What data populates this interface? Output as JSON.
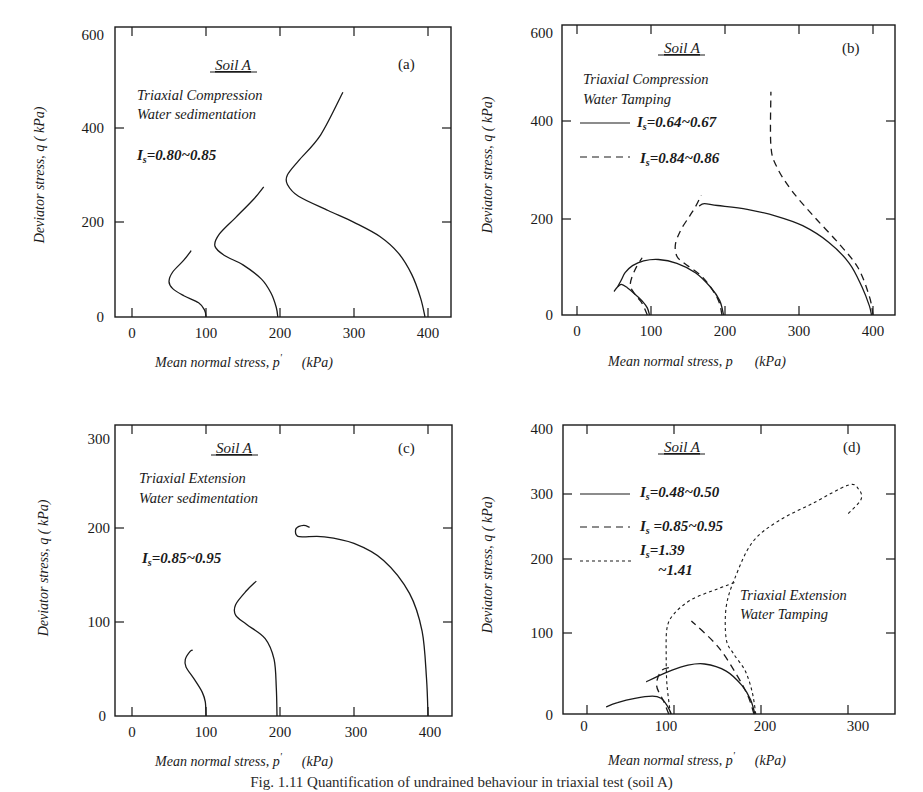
{
  "figure_caption": "Fig. 1.11  Quantification of undrained behaviour in triaxial test (soil A)",
  "chart_data": [
    {
      "id": "a",
      "type": "line",
      "panel_label": "(a)",
      "title": "Soil A",
      "annotations": [
        "Triaxial Compression",
        "Water sedimentation",
        "Is=0.80~0.85"
      ],
      "xlabel": "Mean normal stress, p'  (kPa)",
      "ylabel": "Deviator stress, q  (kPa)",
      "xlim": [
        -25,
        425
      ],
      "ylim": [
        0,
        600
      ],
      "xticks": [
        0,
        100,
        200,
        300,
        400
      ],
      "yticks": [
        0,
        200,
        400,
        600
      ],
      "grid": false,
      "frame": {
        "left": 115,
        "right": 451,
        "top": 27,
        "bottom": 317,
        "x0px": 132,
        "x1px": 428,
        "x0": 0,
        "x1": 400,
        "y0px": 317,
        "y1px": 33,
        "y0": 0,
        "y1": 600
      },
      "series": [
        {
          "name": "p0=100",
          "style": "solid",
          "points": [
            [
              100,
              0
            ],
            [
              98,
              15
            ],
            [
              90,
              30
            ],
            [
              70,
              45
            ],
            [
              55,
              60
            ],
            [
              50,
              75
            ],
            [
              55,
              95
            ],
            [
              70,
              120
            ],
            [
              80,
              140
            ]
          ]
        },
        {
          "name": "p0=200",
          "style": "solid",
          "points": [
            [
              197,
              0
            ],
            [
              195,
              20
            ],
            [
              188,
              50
            ],
            [
              175,
              80
            ],
            [
              150,
              110
            ],
            [
              125,
              130
            ],
            [
              112,
              150
            ],
            [
              118,
              175
            ],
            [
              140,
              210
            ],
            [
              165,
              250
            ],
            [
              178,
              275
            ]
          ]
        },
        {
          "name": "p0=400",
          "style": "solid",
          "points": [
            [
              396,
              0
            ],
            [
              390,
              40
            ],
            [
              378,
              90
            ],
            [
              360,
              135
            ],
            [
              335,
              170
            ],
            [
              300,
              200
            ],
            [
              265,
              225
            ],
            [
              225,
              255
            ],
            [
              210,
              280
            ],
            [
              210,
              300
            ],
            [
              225,
              330
            ],
            [
              255,
              385
            ],
            [
              285,
              475
            ]
          ]
        }
      ]
    },
    {
      "id": "b",
      "type": "line",
      "panel_label": "(b)",
      "title": "Soil A",
      "annotations": [
        "Triaxial Compression",
        "Water Tamping"
      ],
      "legend": [
        {
          "label": "Is=0.64~0.67",
          "style": "solid"
        },
        {
          "label": "Is=0.84~0.86",
          "style": "dashed"
        }
      ],
      "xlabel": "Mean normal stress, p  (kPa)",
      "ylabel": "Deviator stress, q  (kPa)",
      "xlim": [
        -25,
        425
      ],
      "ylim": [
        0,
        600
      ],
      "xticks": [
        0,
        100,
        200,
        300,
        400
      ],
      "yticks": [
        0,
        200,
        400,
        600
      ],
      "grid": false,
      "frame": {
        "left": 562,
        "right": 895,
        "top": 25,
        "bottom": 315,
        "x0px": 577,
        "x1px": 873,
        "x0": 0,
        "x1": 400,
        "y0px": 315,
        "y1px": 33,
        "y0": 0,
        "y1": 600
      },
      "series": [
        {
          "name": "Is=0.64~0.67 p0=100",
          "style": "solid",
          "points": [
            [
              98,
              0
            ],
            [
              95,
              15
            ],
            [
              88,
              30
            ],
            [
              78,
              45
            ],
            [
              68,
              58
            ],
            [
              60,
              65
            ],
            [
              55,
              60
            ],
            [
              50,
              50
            ]
          ]
        },
        {
          "name": "Is=0.64~0.67 p0=200",
          "style": "solid",
          "points": [
            [
              198,
              0
            ],
            [
              193,
              30
            ],
            [
              180,
              60
            ],
            [
              160,
              90
            ],
            [
              135,
              110
            ],
            [
              110,
              118
            ],
            [
              90,
              115
            ],
            [
              75,
              105
            ],
            [
              65,
              90
            ],
            [
              60,
              75
            ],
            [
              55,
              60
            ]
          ]
        },
        {
          "name": "Is=0.64~0.67 p0=400",
          "style": "solid",
          "points": [
            [
              398,
              0
            ],
            [
              395,
              20
            ],
            [
              385,
              60
            ],
            [
              368,
              110
            ],
            [
              340,
              155
            ],
            [
              305,
              190
            ],
            [
              270,
              210
            ],
            [
              230,
              225
            ],
            [
              190,
              233
            ],
            [
              172,
              237
            ],
            [
              165,
              232
            ]
          ]
        },
        {
          "name": "Is=0.84~0.86 p0=100",
          "style": "dashed",
          "points": [
            [
              95,
              0
            ],
            [
              88,
              25
            ],
            [
              78,
              45
            ],
            [
              72,
              65
            ],
            [
              78,
              95
            ],
            [
              88,
              122
            ]
          ]
        },
        {
          "name": "Is=0.84~0.86 p0=200",
          "style": "dashed",
          "points": [
            [
              196,
              0
            ],
            [
              190,
              35
            ],
            [
              170,
              80
            ],
            [
              145,
              110
            ],
            [
              135,
              125
            ],
            [
              133,
              150
            ],
            [
              140,
              180
            ],
            [
              152,
              210
            ],
            [
              160,
              230
            ],
            [
              168,
              255
            ]
          ]
        },
        {
          "name": "Is=0.84~0.86 p0=400",
          "style": "dashed",
          "points": [
            [
              400,
              0
            ],
            [
              395,
              40
            ],
            [
              380,
              100
            ],
            [
              355,
              150
            ],
            [
              320,
              210
            ],
            [
              290,
              265
            ],
            [
              270,
              315
            ],
            [
              262,
              360
            ],
            [
              262,
              475
            ]
          ]
        }
      ]
    },
    {
      "id": "c",
      "type": "line",
      "panel_label": "(c)",
      "title": "Soil A",
      "annotations": [
        "Triaxial Extension",
        "Water sedimentation",
        "Is=0.85~0.95"
      ],
      "xlabel": "Mean normal stress, p'  (kPa)",
      "ylabel": "Deviator stress, q  (kPa)",
      "xlim": [
        -25,
        425
      ],
      "ylim": [
        0,
        300
      ],
      "xticks": [
        0,
        100,
        200,
        300,
        400
      ],
      "yticks": [
        0,
        100,
        200,
        300
      ],
      "grid": false,
      "frame": {
        "left": 115,
        "right": 452,
        "top": 425,
        "bottom": 716,
        "x0px": 132,
        "x1px": 428,
        "x0": 0,
        "x1": 400,
        "y0px": 716,
        "y1px": 433,
        "y0": 0,
        "y1": 300
      },
      "series": [
        {
          "name": "p0=100",
          "style": "solid",
          "points": [
            [
              100,
              0
            ],
            [
              99,
              15
            ],
            [
              95,
              25
            ],
            [
              85,
              38
            ],
            [
              73,
              52
            ],
            [
              72,
              60
            ],
            [
              78,
              68
            ],
            [
              82,
              70
            ]
          ]
        },
        {
          "name": "p0=200",
          "style": "solid",
          "points": [
            [
              196,
              0
            ],
            [
              195,
              30
            ],
            [
              192,
              60
            ],
            [
              180,
              82
            ],
            [
              155,
              97
            ],
            [
              140,
              107
            ],
            [
              140,
              118
            ],
            [
              155,
              133
            ],
            [
              168,
              143
            ]
          ]
        },
        {
          "name": "p0=400",
          "style": "solid",
          "points": [
            [
              400,
              0
            ],
            [
              398,
              40
            ],
            [
              392,
              90
            ],
            [
              375,
              130
            ],
            [
              340,
              165
            ],
            [
              300,
              183
            ],
            [
              260,
              190
            ],
            [
              230,
              190
            ],
            [
              222,
              192
            ],
            [
              222,
              199
            ],
            [
              232,
              202
            ],
            [
              240,
              200
            ]
          ]
        }
      ]
    },
    {
      "id": "d",
      "type": "line",
      "panel_label": "(d)",
      "title": "Soil A",
      "annotations": [
        "Triaxial Extension",
        "Water Tamping"
      ],
      "legend": [
        {
          "label": "Is=0.48~0.50",
          "style": "solid"
        },
        {
          "label": "Is =0.85~0.95",
          "style": "dashed"
        },
        {
          "label": "Is=1.39 ~1.41",
          "style": "dotted"
        }
      ],
      "xlabel": "Mean normal stress, p'  (kPa)",
      "ylabel": "Deviator stress, q  (kPa)",
      "xlim": [
        -25,
        350
      ],
      "ylim": [
        0,
        400
      ],
      "xticks": [
        0,
        100,
        200,
        300
      ],
      "yticks": [
        0,
        100,
        200,
        300,
        400
      ],
      "grid": false,
      "frame": {
        "left": 563,
        "right": 895,
        "top": 425,
        "bottom": 714,
        "x0px": 587,
        "x1px": 848,
        "x0": 0,
        "x1": 300,
        "y0px": 714,
        "y1px": 428,
        "y0": 0,
        "y1": 400
      },
      "series": [
        {
          "name": "Is=0.48~0.50 p0=100",
          "style": "solid",
          "points": [
            [
              97,
              0
            ],
            [
              92,
              12
            ],
            [
              85,
              22
            ],
            [
              75,
              25
            ],
            [
              55,
              22
            ],
            [
              35,
              16
            ],
            [
              22,
              10
            ]
          ]
        },
        {
          "name": "Is=0.48~0.50 p0=200",
          "style": "solid",
          "points": [
            [
              193,
              0
            ],
            [
              188,
              20
            ],
            [
              178,
              40
            ],
            [
              160,
              60
            ],
            [
              135,
              70
            ],
            [
              115,
              68
            ],
            [
              95,
              60
            ],
            [
              80,
              52
            ],
            [
              68,
              45
            ]
          ]
        },
        {
          "name": "Is=0.85~0.95 p0=100",
          "style": "dashed",
          "points": [
            [
              94,
              0
            ],
            [
              88,
              18
            ],
            [
              80,
              40
            ],
            [
              85,
              60
            ],
            [
              95,
              65
            ]
          ]
        },
        {
          "name": "Is=0.85~0.95 p0=200",
          "style": "dashed",
          "points": [
            [
              192,
              0
            ],
            [
              185,
              25
            ],
            [
              172,
              55
            ],
            [
              150,
              95
            ],
            [
              120,
              130
            ]
          ]
        },
        {
          "name": "Is=1.39~1.41 p0=100",
          "style": "dotted",
          "points": [
            [
              96,
              0
            ],
            [
              92,
              40
            ],
            [
              91,
              80
            ],
            [
              92,
              120
            ],
            [
              100,
              140
            ],
            [
              120,
              160
            ],
            [
              150,
              175
            ],
            [
              172,
              185
            ]
          ]
        },
        {
          "name": "Is=1.39~1.41 p0=200",
          "style": "dotted",
          "points": [
            [
              194,
              0
            ],
            [
              190,
              30
            ],
            [
              182,
              60
            ],
            [
              168,
              85
            ],
            [
              160,
              105
            ],
            [
              160,
              150
            ],
            [
              170,
              190
            ],
            [
              190,
              240
            ],
            [
              220,
              270
            ],
            [
              260,
              295
            ],
            [
              300,
              320
            ],
            [
              312,
              315
            ],
            [
              315,
              300
            ],
            [
              300,
              280
            ]
          ]
        }
      ]
    }
  ],
  "panels": {
    "a": {
      "title": "Soil A",
      "letter": "(a)",
      "line1": "Triaxial Compression",
      "line2": "Water sedimentation",
      "is_label": "I",
      "is_sub": "s",
      "is_value": "=0.80~0.85",
      "xlabel": "Mean normal stress, p",
      "xprime": "'",
      "xunit": "(kPa)",
      "ylabel": "Deviator stress, q  ( kPa)",
      "xticks": [
        "0",
        "100",
        "200",
        "300",
        "400"
      ],
      "yticks": [
        "0",
        "200",
        "400",
        "600"
      ]
    },
    "b": {
      "title": "Soil A",
      "letter": "(b)",
      "line1": "Triaxial Compression",
      "line2": "Water Tamping",
      "leg1_label": "I",
      "leg1_sub": "s",
      "leg1_value": "=0.64~0.67",
      "leg2_label": "I",
      "leg2_sub": "s",
      "leg2_value": "=0.84~0.86",
      "xlabel": "Mean normal stress, p",
      "xunit": "(kPa)",
      "ylabel": "Deviator stress, q  ( kPa)",
      "xticks": [
        "0",
        "100",
        "200",
        "300",
        "400"
      ],
      "yticks": [
        "0",
        "200",
        "400",
        "600"
      ]
    },
    "c": {
      "title": "Soil A",
      "letter": "(c)",
      "line1": "Triaxial Extension",
      "line2": "Water sedimentation",
      "is_label": "I",
      "is_sub": "s",
      "is_value": "=0.85~0.95",
      "xlabel": "Mean normal stress, p",
      "xprime": "'",
      "xunit": "(kPa)",
      "ylabel": "Deviator stress, q  ( kPa)",
      "xticks": [
        "0",
        "100",
        "200",
        "300",
        "400"
      ],
      "yticks": [
        "0",
        "100",
        "200",
        "300"
      ]
    },
    "d": {
      "title": "Soil A",
      "letter": "(d)",
      "line1": "Triaxial Extension",
      "line2": "Water Tamping",
      "leg1_label": "I",
      "leg1_sub": "s",
      "leg1_value": "=0.48~0.50",
      "leg2_label": "I",
      "leg2_sub": "s",
      "leg2_value": " =0.85~0.95",
      "leg3_label": "I",
      "leg3_sub": "s",
      "leg3_value": "=1.39",
      "leg3_value2": "~1.41",
      "xlabel": "Mean normal stress, p",
      "xprime": "'",
      "xunit": "(kPa)",
      "ylabel": "Deviator stress, q  ( kPa)",
      "xticks": [
        "0",
        "100",
        "200",
        "300"
      ],
      "yticks": [
        "0",
        "100",
        "200",
        "300",
        "400"
      ]
    }
  }
}
